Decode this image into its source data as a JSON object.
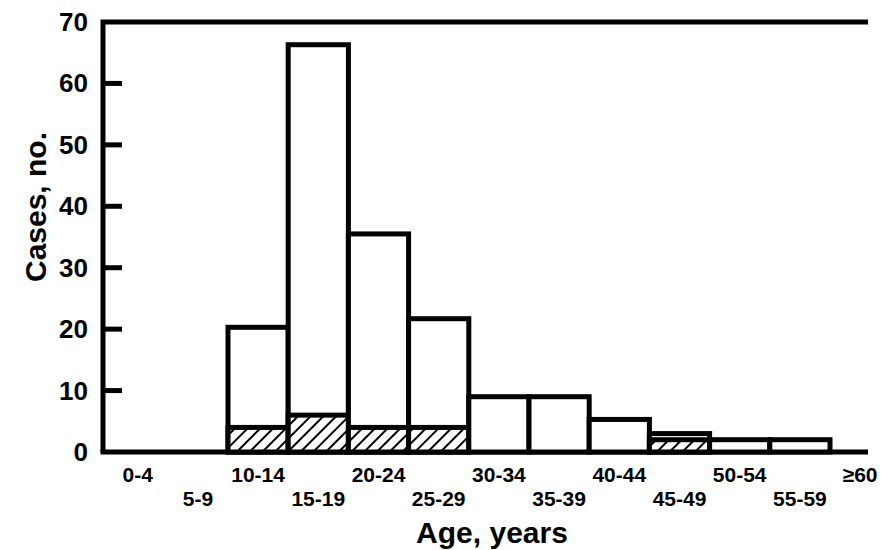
{
  "chart_data": {
    "type": "bar",
    "title": "",
    "subtitle": "",
    "xlabel": "Age, years",
    "ylabel": "Cases, no.",
    "categories": [
      "0-4",
      "5-9",
      "10-14",
      "15-19",
      "20-24",
      "25-29",
      "30-34",
      "35-39",
      "40-44",
      "45-49",
      "50-54",
      "55-59",
      "≥60"
    ],
    "series": [
      {
        "name": "total-cases",
        "style": "open-outline",
        "values": [
          0,
          0,
          20.3,
          66.3,
          35.5,
          21.7,
          9,
          9,
          5.3,
          3,
          2,
          2,
          0
        ]
      },
      {
        "name": "hatched-subset",
        "style": "diagonal-hatch",
        "values": [
          0,
          0,
          4,
          6,
          4,
          4,
          0,
          0,
          0,
          2,
          0,
          0,
          0
        ]
      }
    ],
    "ylim": [
      0,
      70
    ],
    "yticks": [
      0,
      10,
      20,
      30,
      40,
      50,
      60,
      70
    ],
    "ytick_labels": [
      "0",
      "10",
      "20",
      "30",
      "40",
      "50",
      "60",
      "70"
    ],
    "xtick_rows": [
      0,
      1,
      0,
      1,
      0,
      1,
      0,
      1,
      0,
      1,
      0,
      1,
      0
    ],
    "grid": false,
    "legend": "none",
    "frame": "box",
    "tick_direction": "in",
    "colors": {
      "axis": "#000000",
      "bar_stroke": "#000000",
      "bar_fill": "#ffffff",
      "hatch": "#000000",
      "background": "#ffffff"
    }
  }
}
